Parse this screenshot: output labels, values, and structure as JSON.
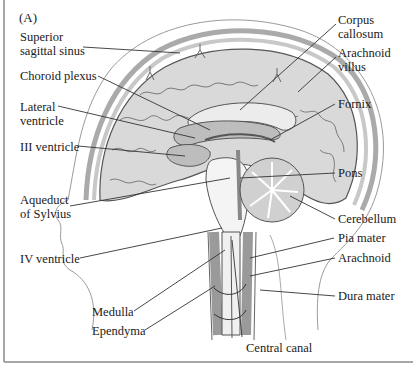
{
  "figure": {
    "panel_label": "(A)",
    "colors": {
      "background": "#ffffff",
      "frame": "#8a8a8a",
      "brain_fill": "#d9d9d9",
      "ventricle_fill": "#bdbdbd",
      "csf_light": "#eeeeee",
      "line": "#333333"
    }
  },
  "labels": {
    "superior_sagittal_sinus": "Superior\nsagittal sinus",
    "choroid_plexus": "Choroid plexus",
    "lateral_ventricle": "Lateral\nventricle",
    "iii_ventricle": "III ventricle",
    "aqueduct_of_sylvius": "Aqueduct\nof Sylvius",
    "iv_ventricle": "IV ventricle",
    "medulla": "Medulla",
    "ependyma": "Ependyma",
    "central_canal": "Central canal",
    "corpus_callosum": "Corpus\ncallosum",
    "arachnoid_villus": "Arachnoid\nvillus",
    "fornix": "Fornix",
    "pons": "Pons",
    "cerebellum": "Cerebellum",
    "pia_mater": "Pia mater",
    "arachnoid": "Arachnoid",
    "dura_mater": "Dura mater"
  }
}
